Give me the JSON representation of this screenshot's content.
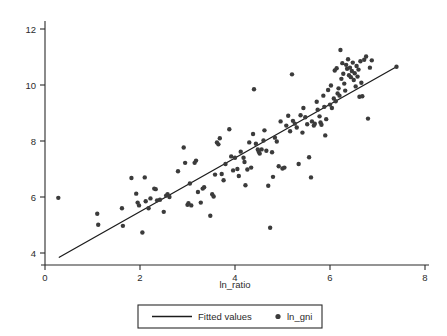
{
  "chart_data": {
    "type": "scatter",
    "title": "",
    "subtitle": "",
    "xlabel": "ln_ratio",
    "ylabel": "",
    "xlim": [
      0,
      8
    ],
    "ylim": [
      4,
      12
    ],
    "xticks": [
      0,
      2,
      4,
      6,
      8
    ],
    "yticks": [
      4,
      6,
      8,
      10,
      12
    ],
    "xtick_labels": [
      "0",
      "2",
      "4",
      "6",
      "8"
    ],
    "ytick_labels": [
      "4",
      "6",
      "8",
      "10",
      "12"
    ],
    "grid": false,
    "legend_position": "below-center",
    "legend": [
      {
        "label": "Fitted values",
        "marker": "line",
        "color": "#1c1c1c"
      },
      {
        "label": "ln_gni",
        "marker": "circle",
        "color": "#3b3b3b"
      }
    ],
    "series": [
      {
        "name": "Fitted values",
        "type": "line",
        "color": "#1c1c1c",
        "slope": 0.958,
        "intercept": 3.56,
        "x": [
          0.3,
          7.4
        ],
        "y": [
          3.85,
          10.65
        ]
      },
      {
        "name": "ln_gni",
        "type": "scatter",
        "color": "#3b3b3b",
        "marker": "circle",
        "marker_size": 2.2,
        "points": [
          [
            0.28,
            5.97
          ],
          [
            1.1,
            5.4
          ],
          [
            1.12,
            5.01
          ],
          [
            1.62,
            5.6
          ],
          [
            1.64,
            4.97
          ],
          [
            1.82,
            6.68
          ],
          [
            1.92,
            6.12
          ],
          [
            1.95,
            5.8
          ],
          [
            1.98,
            5.7
          ],
          [
            2.05,
            4.73
          ],
          [
            2.1,
            6.7
          ],
          [
            2.12,
            5.85
          ],
          [
            2.18,
            5.6
          ],
          [
            2.22,
            5.95
          ],
          [
            2.3,
            6.3
          ],
          [
            2.33,
            6.28
          ],
          [
            2.36,
            5.88
          ],
          [
            2.42,
            5.9
          ],
          [
            2.5,
            5.47
          ],
          [
            2.55,
            6.05
          ],
          [
            2.58,
            6.1
          ],
          [
            2.62,
            6.0
          ],
          [
            2.8,
            6.92
          ],
          [
            2.92,
            7.77
          ],
          [
            2.95,
            7.22
          ],
          [
            3.0,
            5.72
          ],
          [
            3.02,
            5.78
          ],
          [
            3.05,
            6.48
          ],
          [
            3.08,
            5.7
          ],
          [
            3.15,
            7.22
          ],
          [
            3.18,
            7.3
          ],
          [
            3.22,
            6.18
          ],
          [
            3.28,
            5.8
          ],
          [
            3.32,
            6.3
          ],
          [
            3.35,
            6.35
          ],
          [
            3.48,
            5.33
          ],
          [
            3.52,
            6.1
          ],
          [
            3.55,
            6.02
          ],
          [
            3.58,
            6.8
          ],
          [
            3.62,
            7.95
          ],
          [
            3.65,
            7.88
          ],
          [
            3.68,
            8.1
          ],
          [
            3.72,
            6.82
          ],
          [
            3.76,
            6.6
          ],
          [
            3.8,
            7.18
          ],
          [
            3.88,
            8.42
          ],
          [
            3.92,
            7.45
          ],
          [
            3.96,
            6.95
          ],
          [
            4.0,
            7.4
          ],
          [
            4.05,
            7.0
          ],
          [
            4.08,
            6.75
          ],
          [
            4.12,
            7.62
          ],
          [
            4.18,
            7.4
          ],
          [
            4.2,
            7.25
          ],
          [
            4.22,
            6.42
          ],
          [
            4.26,
            6.98
          ],
          [
            4.3,
            7.95
          ],
          [
            4.34,
            7.05
          ],
          [
            4.38,
            8.25
          ],
          [
            4.4,
            9.85
          ],
          [
            4.44,
            7.9
          ],
          [
            4.48,
            7.7
          ],
          [
            4.5,
            7.62
          ],
          [
            4.52,
            7.55
          ],
          [
            4.56,
            7.7
          ],
          [
            4.6,
            8.02
          ],
          [
            4.62,
            8.38
          ],
          [
            4.66,
            7.65
          ],
          [
            4.7,
            6.4
          ],
          [
            4.74,
            4.9
          ],
          [
            4.78,
            7.6
          ],
          [
            4.8,
            6.72
          ],
          [
            4.84,
            8.12
          ],
          [
            4.88,
            7.98
          ],
          [
            4.92,
            7.1
          ],
          [
            4.96,
            8.7
          ],
          [
            5.0,
            7.02
          ],
          [
            5.04,
            7.05
          ],
          [
            5.08,
            8.55
          ],
          [
            5.12,
            8.9
          ],
          [
            5.16,
            8.35
          ],
          [
            5.2,
            10.38
          ],
          [
            5.22,
            8.72
          ],
          [
            5.26,
            8.62
          ],
          [
            5.3,
            8.48
          ],
          [
            5.34,
            7.18
          ],
          [
            5.38,
            8.92
          ],
          [
            5.42,
            8.3
          ],
          [
            5.44,
            9.18
          ],
          [
            5.48,
            8.85
          ],
          [
            5.52,
            8.6
          ],
          [
            5.56,
            7.42
          ],
          [
            5.6,
            6.7
          ],
          [
            5.62,
            8.7
          ],
          [
            5.66,
            8.55
          ],
          [
            5.68,
            8.62
          ],
          [
            5.72,
            9.4
          ],
          [
            5.74,
            9.12
          ],
          [
            5.78,
            8.88
          ],
          [
            5.8,
            8.66
          ],
          [
            5.82,
            8.58
          ],
          [
            5.86,
            9.62
          ],
          [
            5.88,
            9.22
          ],
          [
            5.9,
            8.2
          ],
          [
            5.92,
            8.78
          ],
          [
            5.96,
            9.82
          ],
          [
            6.0,
            9.3
          ],
          [
            6.02,
            9.98
          ],
          [
            6.04,
            9.18
          ],
          [
            6.08,
            9.52
          ],
          [
            6.1,
            10.52
          ],
          [
            6.12,
            9.42
          ],
          [
            6.14,
            10.6
          ],
          [
            6.16,
            9.7
          ],
          [
            6.18,
            9.88
          ],
          [
            6.2,
            9.62
          ],
          [
            6.22,
            11.25
          ],
          [
            6.24,
            10.22
          ],
          [
            6.26,
            10.78
          ],
          [
            6.28,
            10.4
          ],
          [
            6.3,
            10.05
          ],
          [
            6.32,
            9.8
          ],
          [
            6.34,
            10.72
          ],
          [
            6.36,
            10.58
          ],
          [
            6.38,
            10.92
          ],
          [
            6.4,
            10.35
          ],
          [
            6.42,
            10.62
          ],
          [
            6.44,
            10.28
          ],
          [
            6.46,
            10.5
          ],
          [
            6.48,
            10.8
          ],
          [
            6.5,
            10.18
          ],
          [
            6.52,
            10.42
          ],
          [
            6.54,
            9.95
          ],
          [
            6.56,
            10.68
          ],
          [
            6.58,
            10.3
          ],
          [
            6.6,
            10.55
          ],
          [
            6.62,
            9.58
          ],
          [
            6.64,
            10.85
          ],
          [
            6.66,
            10.08
          ],
          [
            6.68,
            9.6
          ],
          [
            6.72,
            10.9
          ],
          [
            6.76,
            11.02
          ],
          [
            6.8,
            8.8
          ],
          [
            6.84,
            10.62
          ],
          [
            6.88,
            10.88
          ],
          [
            7.4,
            10.65
          ]
        ]
      }
    ]
  }
}
